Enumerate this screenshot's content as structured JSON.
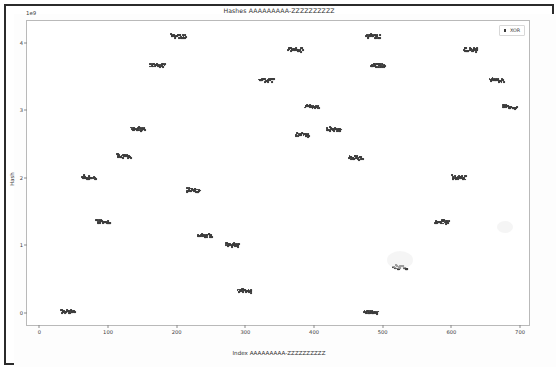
{
  "figure": {
    "title": "Hashes AAAAAAAAA-ZZZZZZZZZZ",
    "offset_text": "1e9",
    "ylabel": "Hash",
    "xlabel": "Index AAAAAAAAA-ZZZZZZZZZZ"
  },
  "legend": {
    "position": "upper-right",
    "entries": [
      {
        "label": "XOR",
        "marker": "square",
        "color": "#3d3d3d"
      }
    ]
  },
  "axis": {
    "xticks": [
      "0",
      "100",
      "200",
      "300",
      "400",
      "500",
      "600",
      "700"
    ],
    "xtick_values": [
      0,
      100,
      200,
      300,
      400,
      500,
      600,
      700
    ],
    "yticks": [
      "0",
      "1",
      "2",
      "3",
      "4"
    ],
    "ytick_values": [
      0,
      1,
      2,
      3,
      4
    ]
  },
  "chart_data": {
    "type": "scatter",
    "title": "Hashes AAAAAAAAA-ZZZZZZZZZZ",
    "xlabel": "Index AAAAAAAAA-ZZZZZZZZZZ",
    "ylabel": "Hash",
    "y_offset_exponent": "1e9",
    "xlim": [
      -18,
      713
    ],
    "ylim": [
      -0.18,
      4.32
    ],
    "grid": false,
    "legend_position": "upper right",
    "marker_color": "#3d3d3d",
    "series": [
      {
        "name": "XOR",
        "clusters": [
          {
            "x": 42,
            "y": 0.02,
            "width": 20
          },
          {
            "x": 72,
            "y": 2.01,
            "width": 20
          },
          {
            "x": 93,
            "y": 1.36,
            "width": 20
          },
          {
            "x": 123,
            "y": 2.33,
            "width": 20
          },
          {
            "x": 144,
            "y": 2.73,
            "width": 20
          },
          {
            "x": 172,
            "y": 3.67,
            "width": 22
          },
          {
            "x": 203,
            "y": 4.1,
            "width": 22
          },
          {
            "x": 224,
            "y": 1.82,
            "width": 20
          },
          {
            "x": 241,
            "y": 1.15,
            "width": 20
          },
          {
            "x": 281,
            "y": 1.01,
            "width": 20
          },
          {
            "x": 299,
            "y": 0.33,
            "width": 20
          },
          {
            "x": 331,
            "y": 3.45,
            "width": 22
          },
          {
            "x": 373,
            "y": 3.9,
            "width": 20
          },
          {
            "x": 383,
            "y": 2.64,
            "width": 20
          },
          {
            "x": 397,
            "y": 3.06,
            "width": 20
          },
          {
            "x": 429,
            "y": 2.72,
            "width": 20
          },
          {
            "x": 461,
            "y": 2.3,
            "width": 20
          },
          {
            "x": 483,
            "y": 0.01,
            "width": 20
          },
          {
            "x": 486,
            "y": 4.1,
            "width": 20
          },
          {
            "x": 493,
            "y": 3.67,
            "width": 20
          },
          {
            "x": 526,
            "y": 0.68,
            "width": 20
          },
          {
            "x": 586,
            "y": 1.35,
            "width": 20
          },
          {
            "x": 611,
            "y": 2.01,
            "width": 20
          },
          {
            "x": 628,
            "y": 3.9,
            "width": 20
          },
          {
            "x": 666,
            "y": 3.45,
            "width": 20
          },
          {
            "x": 685,
            "y": 3.05,
            "width": 20
          }
        ]
      }
    ]
  }
}
